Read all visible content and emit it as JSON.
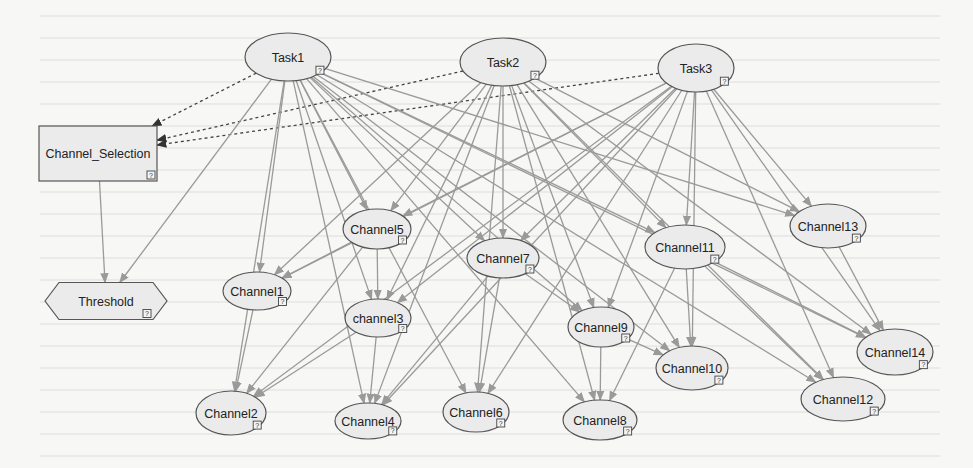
{
  "diagram": {
    "type": "bayesian-network",
    "colors": {
      "background": "#f7f7f5",
      "node_fill": "#ebebeb",
      "node_border": "#555555",
      "edge_solid": "#9a9a9a",
      "edge_dashed": "#444444",
      "text": "#222222"
    },
    "node_badge": "?",
    "nodes": [
      {
        "id": "task1",
        "label": "Task1",
        "shape": "ellipse",
        "cx": 288,
        "cy": 57,
        "rx": 43,
        "ry": 24
      },
      {
        "id": "task2",
        "label": "Task2",
        "shape": "ellipse",
        "cx": 503,
        "cy": 62,
        "rx": 43,
        "ry": 24
      },
      {
        "id": "task3",
        "label": "Task3",
        "shape": "ellipse",
        "cx": 696,
        "cy": 68,
        "rx": 38,
        "ry": 24
      },
      {
        "id": "channel_selection",
        "label": "Channel_Selection",
        "shape": "rect",
        "x": 39,
        "y": 126,
        "w": 118,
        "h": 55
      },
      {
        "id": "threshold",
        "label": "Threshold",
        "shape": "hexagon",
        "cx": 106,
        "cy": 301,
        "w": 122,
        "h": 37
      },
      {
        "id": "channel1",
        "label": "Channel1",
        "shape": "ellipse",
        "cx": 257,
        "cy": 291,
        "rx": 34,
        "ry": 19
      },
      {
        "id": "channel2",
        "label": "Channel2",
        "shape": "ellipse",
        "cx": 231,
        "cy": 413,
        "rx": 35,
        "ry": 22
      },
      {
        "id": "channel3",
        "label": "channel3",
        "shape": "ellipse",
        "cx": 378,
        "cy": 318,
        "rx": 33,
        "ry": 19
      },
      {
        "id": "channel4",
        "label": "Channel4",
        "shape": "ellipse",
        "cx": 368,
        "cy": 421,
        "rx": 33,
        "ry": 18
      },
      {
        "id": "channel5",
        "label": "Channel5",
        "shape": "ellipse",
        "cx": 377,
        "cy": 229,
        "rx": 34,
        "ry": 20
      },
      {
        "id": "channel6",
        "label": "Channel6",
        "shape": "ellipse",
        "cx": 476,
        "cy": 412,
        "rx": 33,
        "ry": 20
      },
      {
        "id": "channel7",
        "label": "Channel7",
        "shape": "ellipse",
        "cx": 503,
        "cy": 258,
        "rx": 36,
        "ry": 20
      },
      {
        "id": "channel8",
        "label": "Channel8",
        "shape": "ellipse",
        "cx": 600,
        "cy": 420,
        "rx": 37,
        "ry": 20
      },
      {
        "id": "channel9",
        "label": "Channel9",
        "shape": "ellipse",
        "cx": 601,
        "cy": 327,
        "rx": 33,
        "ry": 20
      },
      {
        "id": "channel10",
        "label": "Channel10",
        "shape": "ellipse",
        "cx": 692,
        "cy": 368,
        "rx": 36,
        "ry": 22
      },
      {
        "id": "channel11",
        "label": "Channel11",
        "shape": "ellipse",
        "cx": 685,
        "cy": 247,
        "rx": 40,
        "ry": 22
      },
      {
        "id": "channel12",
        "label": "Channel12",
        "shape": "ellipse",
        "cx": 843,
        "cy": 399,
        "rx": 42,
        "ry": 22
      },
      {
        "id": "channel13",
        "label": "Channel13",
        "shape": "ellipse",
        "cx": 828,
        "cy": 226,
        "rx": 38,
        "ry": 22
      },
      {
        "id": "channel14",
        "label": "Channel14",
        "shape": "ellipse",
        "cx": 895,
        "cy": 352,
        "rx": 38,
        "ry": 23
      }
    ],
    "edges": [
      {
        "from": "task1",
        "to": "channel_selection",
        "style": "dashed"
      },
      {
        "from": "task2",
        "to": "channel_selection",
        "style": "dashed"
      },
      {
        "from": "task3",
        "to": "channel_selection",
        "style": "dashed"
      },
      {
        "from": "channel_selection",
        "to": "threshold",
        "style": "solid"
      },
      {
        "from": "task1",
        "to": "threshold",
        "style": "solid"
      },
      {
        "from": "task1",
        "to": "channel1",
        "style": "solid"
      },
      {
        "from": "task1",
        "to": "channel2",
        "style": "solid"
      },
      {
        "from": "task1",
        "to": "channel3",
        "style": "solid"
      },
      {
        "from": "task1",
        "to": "channel4",
        "style": "solid"
      },
      {
        "from": "task1",
        "to": "channel5",
        "style": "solid"
      },
      {
        "from": "task1",
        "to": "channel6",
        "style": "solid"
      },
      {
        "from": "task1",
        "to": "channel7",
        "style": "solid"
      },
      {
        "from": "task1",
        "to": "channel8",
        "style": "solid"
      },
      {
        "from": "task1",
        "to": "channel9",
        "style": "solid"
      },
      {
        "from": "task1",
        "to": "channel10",
        "style": "solid"
      },
      {
        "from": "task1",
        "to": "channel11",
        "style": "solid"
      },
      {
        "from": "task1",
        "to": "channel12",
        "style": "solid"
      },
      {
        "from": "task1",
        "to": "channel13",
        "style": "solid"
      },
      {
        "from": "task1",
        "to": "channel14",
        "style": "solid"
      },
      {
        "from": "task2",
        "to": "channel1",
        "style": "solid"
      },
      {
        "from": "task2",
        "to": "channel3",
        "style": "solid"
      },
      {
        "from": "task2",
        "to": "channel4",
        "style": "solid"
      },
      {
        "from": "task2",
        "to": "channel5",
        "style": "solid"
      },
      {
        "from": "task2",
        "to": "channel6",
        "style": "solid"
      },
      {
        "from": "task2",
        "to": "channel7",
        "style": "solid"
      },
      {
        "from": "task2",
        "to": "channel8",
        "style": "solid"
      },
      {
        "from": "task2",
        "to": "channel9",
        "style": "solid"
      },
      {
        "from": "task2",
        "to": "channel10",
        "style": "solid"
      },
      {
        "from": "task2",
        "to": "channel11",
        "style": "solid"
      },
      {
        "from": "task2",
        "to": "channel12",
        "style": "solid"
      },
      {
        "from": "task2",
        "to": "channel13",
        "style": "solid"
      },
      {
        "from": "task2",
        "to": "channel14",
        "style": "solid"
      },
      {
        "from": "task3",
        "to": "channel1",
        "style": "solid"
      },
      {
        "from": "task3",
        "to": "channel2",
        "style": "solid"
      },
      {
        "from": "task3",
        "to": "channel3",
        "style": "solid"
      },
      {
        "from": "task3",
        "to": "channel4",
        "style": "solid"
      },
      {
        "from": "task3",
        "to": "channel5",
        "style": "solid"
      },
      {
        "from": "task3",
        "to": "channel6",
        "style": "solid"
      },
      {
        "from": "task3",
        "to": "channel7",
        "style": "solid"
      },
      {
        "from": "task3",
        "to": "channel9",
        "style": "solid"
      },
      {
        "from": "task3",
        "to": "channel10",
        "style": "solid"
      },
      {
        "from": "task3",
        "to": "channel11",
        "style": "solid"
      },
      {
        "from": "task3",
        "to": "channel12",
        "style": "solid"
      },
      {
        "from": "task3",
        "to": "channel13",
        "style": "solid"
      },
      {
        "from": "task3",
        "to": "channel14",
        "style": "solid"
      },
      {
        "from": "channel5",
        "to": "channel1",
        "style": "solid"
      },
      {
        "from": "channel5",
        "to": "channel3",
        "style": "solid"
      },
      {
        "from": "channel1",
        "to": "channel2",
        "style": "solid"
      },
      {
        "from": "channel3",
        "to": "channel2",
        "style": "solid"
      },
      {
        "from": "channel5",
        "to": "channel2",
        "style": "solid"
      },
      {
        "from": "channel3",
        "to": "channel4",
        "style": "solid"
      },
      {
        "from": "channel7",
        "to": "channel4",
        "style": "solid"
      },
      {
        "from": "channel7",
        "to": "channel6",
        "style": "solid"
      },
      {
        "from": "channel7",
        "to": "channel9",
        "style": "solid"
      },
      {
        "from": "channel9",
        "to": "channel8",
        "style": "solid"
      },
      {
        "from": "channel9",
        "to": "channel10",
        "style": "solid"
      },
      {
        "from": "channel11",
        "to": "channel10",
        "style": "solid"
      },
      {
        "from": "channel11",
        "to": "channel14",
        "style": "solid"
      },
      {
        "from": "channel11",
        "to": "channel12",
        "style": "solid"
      },
      {
        "from": "channel11",
        "to": "channel8",
        "style": "solid"
      },
      {
        "from": "channel13",
        "to": "channel14",
        "style": "solid"
      }
    ]
  }
}
